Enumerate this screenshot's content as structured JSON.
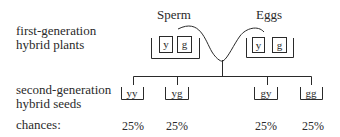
{
  "labels": {
    "first_gen_line1": "first-generation",
    "first_gen_line2": "hybrid plants",
    "second_gen_line1": "second-generation",
    "second_gen_line2": "hybrid seeds",
    "chances": "chances:"
  },
  "gametes": {
    "sperm": {
      "title": "Sperm",
      "alleles": [
        "y",
        "g"
      ]
    },
    "eggs": {
      "title": "Eggs",
      "alleles": [
        "y",
        "g"
      ]
    }
  },
  "offspring": [
    {
      "genotype": "yy",
      "chance": "25%"
    },
    {
      "genotype": "yg",
      "chance": "25%"
    },
    {
      "genotype": "gy",
      "chance": "25%"
    },
    {
      "genotype": "gg",
      "chance": "25%"
    }
  ],
  "colors": {
    "ink": "#2a2a2a",
    "background": "#ffffff"
  }
}
